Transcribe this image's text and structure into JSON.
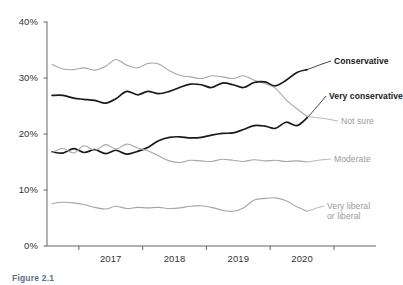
{
  "figure": {
    "caption": "Figure 2.1"
  },
  "chart_data": {
    "type": "line",
    "title": "",
    "xlabel": "",
    "ylabel": "",
    "xlim": [
      2016.5,
      2020.75
    ],
    "ylim": [
      0,
      40
    ],
    "yticks": [
      0,
      10,
      20,
      30,
      40
    ],
    "ytick_labels": [
      "0%",
      "10%",
      "20%",
      "30%",
      "40%"
    ],
    "xticks": [
      2017,
      2018,
      2019,
      2020,
      2021
    ],
    "xtick_labels": [
      "2017",
      "2018",
      "2019",
      "2020"
    ],
    "grid": false,
    "legend_position": "right-inline-labels",
    "series": [
      {
        "name": "Not sure",
        "label": "Not sure",
        "color": "#a6a6a6",
        "width": 1.1,
        "style": "gray",
        "label_xy": [
          341,
          117
        ],
        "x": [
          2016.58,
          2016.75,
          2016.92,
          2017.08,
          2017.25,
          2017.42,
          2017.58,
          2017.75,
          2017.92,
          2018.08,
          2018.25,
          2018.42,
          2018.58,
          2018.75,
          2018.92,
          2019.08,
          2019.25,
          2019.42,
          2019.58,
          2019.75,
          2019.92,
          2020.08,
          2020.25,
          2020.42,
          2020.58
        ],
        "y": [
          32.4,
          31.6,
          31.5,
          31.8,
          31.4,
          32.1,
          33.3,
          32.3,
          31.8,
          32.6,
          32.5,
          31.3,
          30.5,
          30.2,
          29.9,
          30.4,
          30.2,
          29.9,
          30.4,
          29.6,
          29.0,
          28.2,
          26.1,
          24.5,
          23.1
        ]
      },
      {
        "name": "Conservative",
        "label": "Conservative",
        "color": "#1a1a1a",
        "width": 1.7,
        "style": "dark",
        "label_xy": [
          334,
          57
        ],
        "x": [
          2016.58,
          2016.75,
          2016.92,
          2017.08,
          2017.25,
          2017.42,
          2017.58,
          2017.75,
          2017.92,
          2018.08,
          2018.25,
          2018.42,
          2018.58,
          2018.75,
          2018.92,
          2019.08,
          2019.25,
          2019.42,
          2019.58,
          2019.75,
          2019.92,
          2020.08,
          2020.25,
          2020.42,
          2020.58
        ],
        "y": [
          26.9,
          26.9,
          26.4,
          26.2,
          26.0,
          25.5,
          26.3,
          27.6,
          27.0,
          27.6,
          27.2,
          27.6,
          28.3,
          28.9,
          28.8,
          28.3,
          29.1,
          28.8,
          28.3,
          29.2,
          29.3,
          28.6,
          29.6,
          31.0,
          31.5
        ]
      },
      {
        "name": "Very conservative",
        "label": "Very conservative",
        "color": "#1a1a1a",
        "width": 1.7,
        "style": "dark",
        "label_xy": [
          329,
          92
        ],
        "x": [
          2016.58,
          2016.75,
          2016.92,
          2017.08,
          2017.25,
          2017.42,
          2017.58,
          2017.75,
          2017.92,
          2018.08,
          2018.25,
          2018.42,
          2018.58,
          2018.75,
          2018.92,
          2019.08,
          2019.25,
          2019.42,
          2019.58,
          2019.75,
          2019.92,
          2020.08,
          2020.25,
          2020.42,
          2020.58
        ],
        "y": [
          16.8,
          16.6,
          17.4,
          16.7,
          17.2,
          16.5,
          17.1,
          16.4,
          16.9,
          17.6,
          18.8,
          19.4,
          19.5,
          19.3,
          19.4,
          19.8,
          20.1,
          20.2,
          20.8,
          21.5,
          21.4,
          21.0,
          22.1,
          21.5,
          22.9
        ]
      },
      {
        "name": "Moderate",
        "label": "Moderate",
        "color": "#a6a6a6",
        "width": 1.1,
        "style": "gray",
        "label_xy": [
          334,
          155
        ],
        "x": [
          2016.58,
          2016.75,
          2016.92,
          2017.08,
          2017.25,
          2017.42,
          2017.58,
          2017.75,
          2017.92,
          2018.08,
          2018.25,
          2018.42,
          2018.58,
          2018.75,
          2018.92,
          2019.08,
          2019.25,
          2019.42,
          2019.58,
          2019.75,
          2019.92,
          2020.08,
          2020.25,
          2020.42,
          2020.58
        ],
        "y": [
          16.7,
          17.4,
          16.6,
          17.9,
          17.1,
          18.1,
          17.3,
          18.2,
          17.5,
          17.0,
          16.1,
          15.2,
          14.9,
          15.3,
          15.2,
          15.1,
          15.5,
          15.3,
          15.1,
          15.4,
          15.2,
          15.3,
          15.1,
          15.2,
          15.0
        ]
      },
      {
        "name": "Very liberal or liberal",
        "label": "Very liberal\nor liberal",
        "color": "#a6a6a6",
        "width": 1.1,
        "style": "gray",
        "label_xy": [
          327,
          202
        ],
        "x": [
          2016.58,
          2016.75,
          2016.92,
          2017.08,
          2017.25,
          2017.42,
          2017.58,
          2017.75,
          2017.92,
          2018.08,
          2018.25,
          2018.42,
          2018.58,
          2018.75,
          2018.92,
          2019.08,
          2019.25,
          2019.42,
          2019.58,
          2019.75,
          2019.92,
          2020.08,
          2020.25,
          2020.42,
          2020.58
        ],
        "y": [
          7.6,
          7.8,
          7.7,
          7.4,
          6.9,
          6.6,
          7.1,
          6.7,
          6.9,
          6.8,
          6.9,
          6.7,
          6.8,
          7.1,
          7.2,
          6.9,
          6.4,
          6.2,
          6.8,
          8.2,
          8.5,
          8.6,
          8.1,
          7.0,
          6.2
        ]
      }
    ]
  }
}
